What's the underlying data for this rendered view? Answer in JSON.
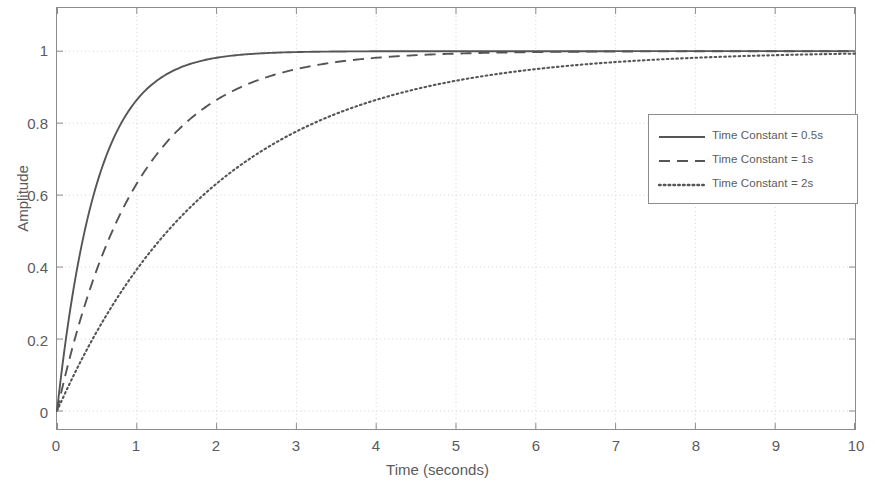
{
  "chart_data": {
    "type": "line",
    "title": "",
    "xlabel": "Time (seconds)",
    "ylabel": "Amplitude",
    "xlim": [
      0,
      10
    ],
    "ylim": [
      -0.05,
      1.12
    ],
    "xticks": [
      "0",
      "1",
      "2",
      "3",
      "4",
      "5",
      "6",
      "7",
      "8",
      "9",
      "10"
    ],
    "xtick_values": [
      0,
      1,
      2,
      3,
      4,
      5,
      6,
      7,
      8,
      9,
      10
    ],
    "yticks": [
      "0",
      "0.2",
      "0.4",
      "0.6",
      "0.8",
      "1"
    ],
    "ytick_values": [
      0,
      0.2,
      0.4,
      0.6,
      0.8,
      1
    ],
    "grid": true,
    "legend_position": "center-right",
    "line_color": "#555555",
    "grid_color": "#d4d4d4",
    "axis_color": "#8c8c8c",
    "series": [
      {
        "name": "Time Constant = 0.5s",
        "style": "solid",
        "tau": 0.5,
        "x": [
          0,
          0.25,
          0.5,
          0.75,
          1,
          1.25,
          1.5,
          1.75,
          2,
          2.5,
          3,
          3.5,
          4,
          5,
          6,
          7,
          8,
          9,
          10
        ],
        "values": [
          0,
          0.393,
          0.632,
          0.777,
          0.865,
          0.918,
          0.95,
          0.97,
          0.982,
          0.993,
          0.998,
          0.999,
          1.0,
          1.0,
          1.0,
          1.0,
          1.0,
          1.0,
          1.0
        ]
      },
      {
        "name": "Time Constant = 1s",
        "style": "dashed",
        "tau": 1,
        "x": [
          0,
          0.5,
          1,
          1.5,
          2,
          2.5,
          3,
          3.5,
          4,
          4.5,
          5,
          6,
          7,
          8,
          9,
          10
        ],
        "values": [
          0,
          0.393,
          0.632,
          0.777,
          0.865,
          0.918,
          0.95,
          0.97,
          0.982,
          0.989,
          0.993,
          0.998,
          0.999,
          1.0,
          1.0,
          1.0
        ]
      },
      {
        "name": "Time Constant = 2s",
        "style": "dotted",
        "tau": 2,
        "x": [
          0,
          1,
          2,
          3,
          4,
          5,
          6,
          7,
          8,
          9,
          10
        ],
        "values": [
          0,
          0.393,
          0.632,
          0.777,
          0.865,
          0.918,
          0.95,
          0.97,
          0.982,
          0.989,
          0.993
        ]
      }
    ]
  }
}
